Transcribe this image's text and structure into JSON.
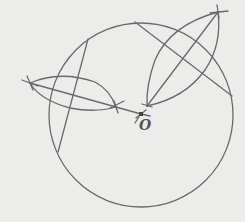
{
  "diagram": {
    "type": "geometric-construction",
    "colors": {
      "background": "#ececea",
      "stroke": "#6a6a6a",
      "point": "#444444"
    },
    "circle": {
      "cx": 141,
      "cy": 115,
      "r": 92
    },
    "center_point": {
      "label": "O",
      "x": 141,
      "y": 114
    },
    "chords": [
      {
        "name": "chord-left",
        "x1": 88,
        "y1": 39,
        "x2": 58,
        "y2": 152
      },
      {
        "name": "chord-right",
        "x1": 135,
        "y1": 22,
        "x2": 232,
        "y2": 96
      }
    ],
    "bisectors": [
      {
        "name": "bisector-left",
        "from": [
          30,
          83
        ],
        "to": [
          141,
          114
        ],
        "arc_points": [
          [
            30,
            83
          ],
          [
            116,
            107
          ]
        ]
      },
      {
        "name": "bisector-right",
        "from": [
          218,
          12
        ],
        "to": [
          147,
          106
        ],
        "arc_points": [
          [
            218,
            12
          ],
          [
            147,
            106
          ]
        ]
      }
    ]
  }
}
